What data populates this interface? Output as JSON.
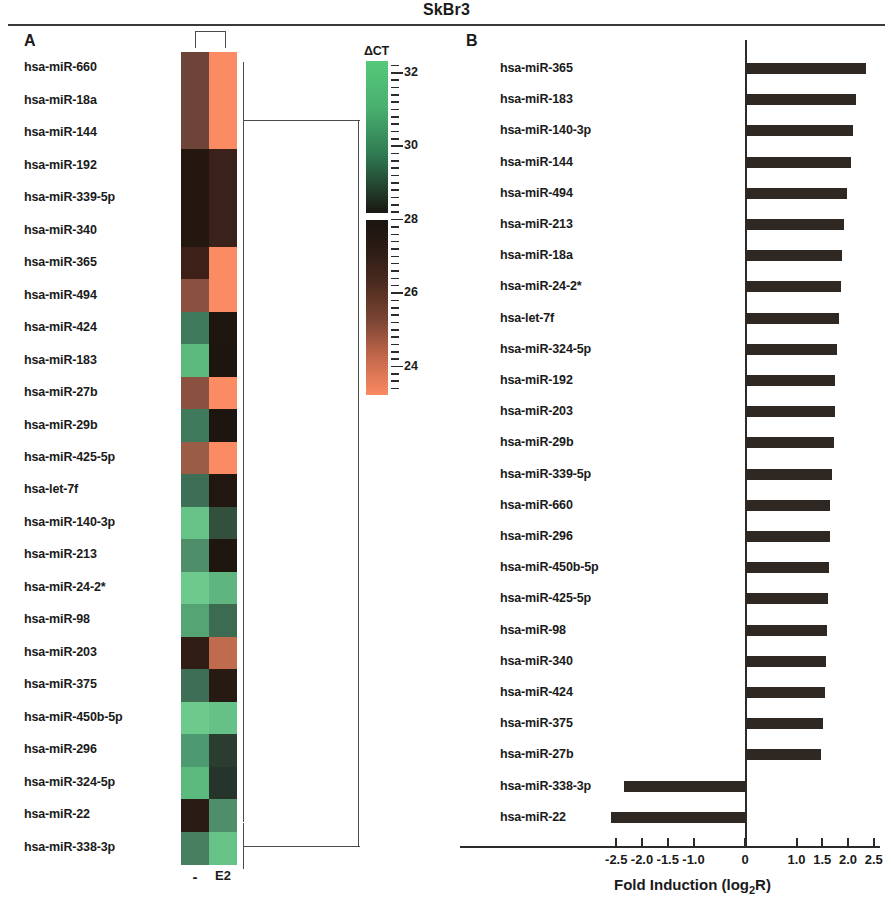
{
  "figure": {
    "title": "SkBr3",
    "panel_a_letter": "A",
    "panel_b_letter": "B"
  },
  "panel_a": {
    "column_labels": [
      "-",
      "E2"
    ],
    "colorbar": {
      "title": "ΔCT",
      "tick_labels": [
        "32",
        "30",
        "28",
        "26",
        "24"
      ],
      "tick_values": [
        32,
        30,
        28,
        26,
        24
      ],
      "range": [
        23.2,
        32.3
      ],
      "color_high": "#55c87a",
      "color_mid": "#1a1410",
      "color_low": "#fa8a62"
    },
    "rows": [
      {
        "name": "hsa-miR-660",
        "minus": "#6e4338",
        "e2": "#fb8b63"
      },
      {
        "name": "hsa-miR-18a",
        "minus": "#6e4338",
        "e2": "#fb8b63"
      },
      {
        "name": "hsa-miR-144",
        "minus": "#6e4338",
        "e2": "#fb8b63"
      },
      {
        "name": "hsa-miR-192",
        "minus": "#231710",
        "e2": "#3a211a"
      },
      {
        "name": "hsa-miR-339-5p",
        "minus": "#231710",
        "e2": "#3a211a"
      },
      {
        "name": "hsa-miR-340",
        "minus": "#231710",
        "e2": "#3a211a"
      },
      {
        "name": "hsa-miR-365",
        "minus": "#3d2119",
        "e2": "#fb8b63"
      },
      {
        "name": "hsa-miR-494",
        "minus": "#8a5040",
        "e2": "#fb8b63"
      },
      {
        "name": "hsa-miR-424",
        "minus": "#3f7a5d",
        "e2": "#201610"
      },
      {
        "name": "hsa-miR-183",
        "minus": "#5cb97e",
        "e2": "#1d1510"
      },
      {
        "name": "hsa-miR-27b",
        "minus": "#8a5040",
        "e2": "#fb8b63"
      },
      {
        "name": "hsa-miR-29b",
        "minus": "#3f7a5d",
        "e2": "#1d1510"
      },
      {
        "name": "hsa-miR-425-5p",
        "minus": "#9a5c46",
        "e2": "#fb8b63"
      },
      {
        "name": "hsa-let-7f",
        "minus": "#3c6f55",
        "e2": "#221710"
      },
      {
        "name": "hsa-miR-140-3p",
        "minus": "#66c287",
        "e2": "#33503f"
      },
      {
        "name": "hsa-miR-213",
        "minus": "#4e8f6a",
        "e2": "#1f1610"
      },
      {
        "name": "hsa-miR-24-2*",
        "minus": "#6ec98c",
        "e2": "#5fb47f"
      },
      {
        "name": "hsa-miR-98",
        "minus": "#55a574",
        "e2": "#3d6b51"
      },
      {
        "name": "hsa-miR-203",
        "minus": "#2f1d16",
        "e2": "#c06a4e"
      },
      {
        "name": "hsa-miR-375",
        "minus": "#3e6f56",
        "e2": "#261a12"
      },
      {
        "name": "hsa-miR-450b-5p",
        "minus": "#6ec98c",
        "e2": "#65c187"
      },
      {
        "name": "hsa-miR-296",
        "minus": "#4e9a70",
        "e2": "#2a3d30"
      },
      {
        "name": "hsa-miR-324-5p",
        "minus": "#5cb97e",
        "e2": "#26352b"
      },
      {
        "name": "hsa-miR-22",
        "minus": "#2a1b14",
        "e2": "#4e8f6a"
      },
      {
        "name": "hsa-miR-338-3p",
        "minus": "#477f60",
        "e2": "#66c287"
      }
    ]
  },
  "chart_data": {
    "type": "bar",
    "orientation": "horizontal",
    "title": "",
    "xlabel": "Fold Induction (log2R)",
    "ylabel": "",
    "xlim": [
      -2.75,
      2.75
    ],
    "xticks": [
      -2.5,
      -2.0,
      -1.5,
      -1.0,
      0,
      1.0,
      1.5,
      2.0,
      2.5
    ],
    "xtick_labels": [
      "-2.5",
      "-2.0",
      "-1.5",
      "-1.0",
      "0",
      "1.0",
      "1.5",
      "2.0",
      "2.5"
    ],
    "grid": false,
    "legend": null,
    "bar_color": "#2e2722",
    "categories": [
      "hsa-miR-365",
      "hsa-miR-183",
      "hsa-miR-140-3p",
      "hsa-miR-144",
      "hsa-miR-494",
      "hsa-miR-213",
      "hsa-miR-18a",
      "hsa-miR-24-2*",
      "hsa-let-7f",
      "hsa-miR-324-5p",
      "hsa-miR-192",
      "hsa-miR-203",
      "hsa-miR-29b",
      "hsa-miR-339-5p",
      "hsa-miR-660",
      "hsa-miR-296",
      "hsa-miR-450b-5p",
      "hsa-miR-425-5p",
      "hsa-miR-98",
      "hsa-miR-340",
      "hsa-miR-424",
      "hsa-miR-375",
      "hsa-miR-27b",
      "hsa-miR-338-3p",
      "hsa-miR-22"
    ],
    "values": [
      2.35,
      2.15,
      2.1,
      2.05,
      1.98,
      1.93,
      1.88,
      1.86,
      1.82,
      1.78,
      1.75,
      1.74,
      1.72,
      1.68,
      1.66,
      1.65,
      1.63,
      1.62,
      1.6,
      1.58,
      1.56,
      1.52,
      1.48,
      -2.35,
      -2.6
    ]
  },
  "panel_b": {
    "axis_title_main": "Fold Induction (log",
    "axis_title_sub": "2",
    "axis_title_end": "R)"
  }
}
